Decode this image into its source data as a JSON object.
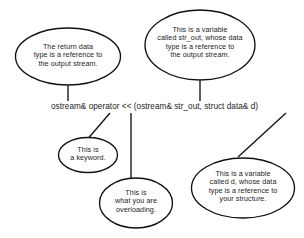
{
  "diagram": {
    "background_color": "#ffffff",
    "stroke_color": "#111111",
    "text_color": "#1d1d1d",
    "code": {
      "text": "ostream& operator << (ostream& str_out, struct data& d)"
    },
    "callouts": [
      {
        "id": "return-type",
        "text": "The return data\ntype is a reference to\nthe output stream."
      },
      {
        "id": "str-out-param",
        "text": "This is a variable\ncalled str_out, whose data\ntype is a reference to\nthe output stream."
      },
      {
        "id": "keyword",
        "text": "This is\na keyword."
      },
      {
        "id": "overloading",
        "text": "This is\nwhat you are\noverloading."
      },
      {
        "id": "data-param",
        "text": "This is a variable\ncalled d, whose data\ntype is a reference to\nyour structure."
      }
    ]
  }
}
